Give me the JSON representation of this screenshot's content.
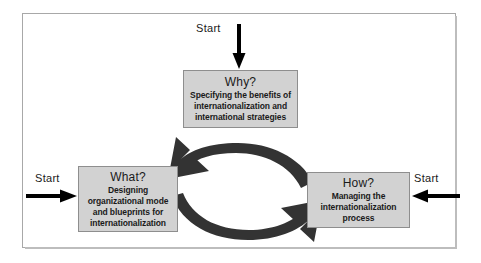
{
  "diagram": {
    "frame": {
      "border_color": "#a8a8a8",
      "background": "#ffffff"
    },
    "box_fill": "#d2d2d2",
    "box_border": "#8e8e8e",
    "arrow_color": "#333333",
    "start_arrow_color": "#000000",
    "nodes": [
      {
        "id": "why",
        "title": "Why?",
        "lines": [
          "Specifying the benefits of",
          "internationalization and",
          "international strategies"
        ]
      },
      {
        "id": "what",
        "title": "What?",
        "lines": [
          "Designing",
          "organizational mode",
          "and blueprints for",
          "internationalization"
        ]
      },
      {
        "id": "how",
        "title": "How?",
        "lines": [
          "Managing the",
          "internationalization",
          "process"
        ]
      }
    ],
    "entry_points": [
      {
        "id": "start-top",
        "label": "Start",
        "direction": "down",
        "target": "why"
      },
      {
        "id": "start-left",
        "label": "Start",
        "direction": "right",
        "target": "what"
      },
      {
        "id": "start-right",
        "label": "Start",
        "direction": "left",
        "target": "how"
      }
    ],
    "cycle": [
      {
        "id": "arc-upper",
        "from": "how",
        "to": "what",
        "style": "curved-block-arrow"
      },
      {
        "id": "arc-lower",
        "from": "what",
        "to": "how",
        "style": "curved-block-arrow"
      }
    ]
  }
}
